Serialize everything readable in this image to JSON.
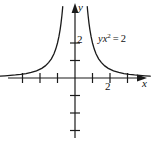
{
  "figure": {
    "background_color": "#ffffff",
    "stroke_color": "#1a1a1a",
    "width": 151,
    "height": 144
  },
  "axes": {
    "x_axis_name": "x",
    "y_axis_name": "y",
    "origin_px": {
      "x": 75,
      "y": 78
    },
    "unit_px": 17.5,
    "x_tick_label": "2",
    "y_tick_label": "2",
    "x_ticks_values": [
      -3,
      -2,
      -1,
      1,
      2,
      3
    ],
    "y_ticks_values": [
      -3,
      -2,
      -1,
      1,
      2
    ],
    "x_range": [
      -4.3,
      4.3
    ],
    "y_range": [
      -3.8,
      4.4
    ],
    "arrowheads": [
      "x-positive",
      "y-positive"
    ],
    "grid": false
  },
  "equation_label": {
    "lhs_var_y": "y",
    "lhs_var_x": "x",
    "exponent": "2",
    "operator": "=",
    "rhs": "2",
    "plain_text": "yx2 = 2"
  },
  "chart_data": {
    "type": "line",
    "xlabel": "x",
    "ylabel": "y",
    "xlim": [
      -4.3,
      4.3
    ],
    "ylim": [
      -3.8,
      4.4
    ],
    "grid": false,
    "legend": "none",
    "annotations": [
      "yx² = 2"
    ],
    "xticks": [
      -3,
      -2,
      -1,
      1,
      2,
      3
    ],
    "yticks": [
      -3,
      -2,
      -1,
      1,
      2
    ],
    "xtick_labels": [
      "",
      "",
      "",
      "",
      "2",
      ""
    ],
    "ytick_labels": [
      "",
      "",
      "",
      "",
      "2"
    ],
    "series": [
      {
        "name": "left branch (x < 0)",
        "x": [
          -4.3,
          -4.0,
          -3.7,
          -3.4,
          -3.1,
          -2.8,
          -2.5,
          -2.2,
          -1.9,
          -1.7,
          -1.5,
          -1.35,
          -1.2,
          -1.1,
          -1.0,
          -0.92,
          -0.85,
          -0.8,
          -0.75,
          -0.72,
          -0.7
        ],
        "y": [
          0.108,
          0.125,
          0.146,
          0.173,
          0.208,
          0.255,
          0.32,
          0.413,
          0.554,
          0.692,
          0.889,
          1.097,
          1.389,
          1.653,
          2.0,
          2.363,
          2.768,
          3.125,
          3.556,
          3.858,
          4.082
        ]
      },
      {
        "name": "right branch (x > 0)",
        "x": [
          0.7,
          0.72,
          0.75,
          0.8,
          0.85,
          0.92,
          1.0,
          1.1,
          1.2,
          1.35,
          1.5,
          1.7,
          1.9,
          2.2,
          2.5,
          2.8,
          3.1,
          3.4,
          3.7,
          4.0,
          4.3
        ],
        "y": [
          4.082,
          3.858,
          3.556,
          3.125,
          2.768,
          2.363,
          2.0,
          1.653,
          1.389,
          1.097,
          0.889,
          0.692,
          0.554,
          0.413,
          0.32,
          0.255,
          0.208,
          0.173,
          0.146,
          0.125,
          0.108
        ]
      }
    ]
  }
}
